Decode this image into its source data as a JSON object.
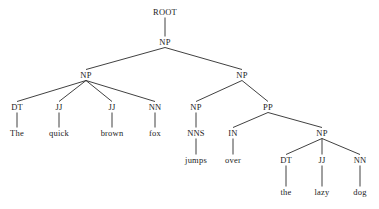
{
  "figure": {
    "sentence": "The quick brown fox jumps over the lazy dog",
    "width": 379,
    "height": 209,
    "background_color": "#ffffff",
    "line_color": "#2b2b2b",
    "text_color": "#1c1c1c"
  },
  "nodes": [
    {
      "id": "root",
      "label": "ROOT",
      "kind": "root",
      "x": 165,
      "y": 12
    },
    {
      "id": "np0",
      "label": "NP",
      "kind": "phrase",
      "x": 165,
      "y": 42
    },
    {
      "id": "np1",
      "label": "NP",
      "kind": "phrase",
      "x": 86,
      "y": 75
    },
    {
      "id": "np2",
      "label": "NP",
      "kind": "phrase",
      "x": 242,
      "y": 75
    },
    {
      "id": "dt1",
      "label": "DT",
      "kind": "pos",
      "x": 17,
      "y": 107
    },
    {
      "id": "jj1",
      "label": "JJ",
      "kind": "pos",
      "x": 59,
      "y": 107
    },
    {
      "id": "jj2",
      "label": "JJ",
      "kind": "pos",
      "x": 112,
      "y": 107
    },
    {
      "id": "nn1",
      "label": "NN",
      "kind": "pos",
      "x": 155,
      "y": 107
    },
    {
      "id": "np3",
      "label": "NP",
      "kind": "phrase",
      "x": 196,
      "y": 107
    },
    {
      "id": "pp1",
      "label": "PP",
      "kind": "phrase",
      "x": 268,
      "y": 107
    },
    {
      "id": "w_the1",
      "label": "The",
      "kind": "word",
      "x": 17,
      "y": 133
    },
    {
      "id": "w_quick",
      "label": "quick",
      "kind": "word",
      "x": 59,
      "y": 133
    },
    {
      "id": "w_brown",
      "label": "brown",
      "kind": "word",
      "x": 112,
      "y": 133
    },
    {
      "id": "w_fox",
      "label": "fox",
      "kind": "word",
      "x": 155,
      "y": 133
    },
    {
      "id": "nns1",
      "label": "NNS",
      "kind": "pos",
      "x": 196,
      "y": 133
    },
    {
      "id": "in1",
      "label": "IN",
      "kind": "pos",
      "x": 233,
      "y": 133
    },
    {
      "id": "np4",
      "label": "NP",
      "kind": "phrase",
      "x": 322,
      "y": 133
    },
    {
      "id": "w_jumps",
      "label": "jumps",
      "kind": "word",
      "x": 196,
      "y": 160
    },
    {
      "id": "w_over",
      "label": "over",
      "kind": "word",
      "x": 233,
      "y": 160
    },
    {
      "id": "dt2",
      "label": "DT",
      "kind": "pos",
      "x": 286,
      "y": 160
    },
    {
      "id": "jj3",
      "label": "JJ",
      "kind": "pos",
      "x": 322,
      "y": 160
    },
    {
      "id": "nn2",
      "label": "NN",
      "kind": "pos",
      "x": 360,
      "y": 160
    },
    {
      "id": "w_the2",
      "label": "the",
      "kind": "word",
      "x": 286,
      "y": 192
    },
    {
      "id": "w_lazy",
      "label": "lazy",
      "kind": "word",
      "x": 322,
      "y": 192
    },
    {
      "id": "w_dog",
      "label": "dog",
      "kind": "word",
      "x": 360,
      "y": 192
    }
  ],
  "edges": [
    {
      "from": "root",
      "to": "np0"
    },
    {
      "from": "np0",
      "to": "np1"
    },
    {
      "from": "np0",
      "to": "np2"
    },
    {
      "from": "np1",
      "to": "dt1"
    },
    {
      "from": "np1",
      "to": "jj1"
    },
    {
      "from": "np1",
      "to": "jj2"
    },
    {
      "from": "np1",
      "to": "nn1"
    },
    {
      "from": "np2",
      "to": "np3"
    },
    {
      "from": "np2",
      "to": "pp1"
    },
    {
      "from": "dt1",
      "to": "w_the1"
    },
    {
      "from": "jj1",
      "to": "w_quick"
    },
    {
      "from": "jj2",
      "to": "w_brown"
    },
    {
      "from": "nn1",
      "to": "w_fox"
    },
    {
      "from": "np3",
      "to": "nns1"
    },
    {
      "from": "pp1",
      "to": "in1"
    },
    {
      "from": "pp1",
      "to": "np4"
    },
    {
      "from": "nns1",
      "to": "w_jumps"
    },
    {
      "from": "in1",
      "to": "w_over"
    },
    {
      "from": "np4",
      "to": "dt2"
    },
    {
      "from": "np4",
      "to": "jj3"
    },
    {
      "from": "np4",
      "to": "nn2"
    },
    {
      "from": "dt2",
      "to": "w_the2"
    },
    {
      "from": "jj3",
      "to": "w_lazy"
    },
    {
      "from": "nn2",
      "to": "w_dog"
    }
  ]
}
